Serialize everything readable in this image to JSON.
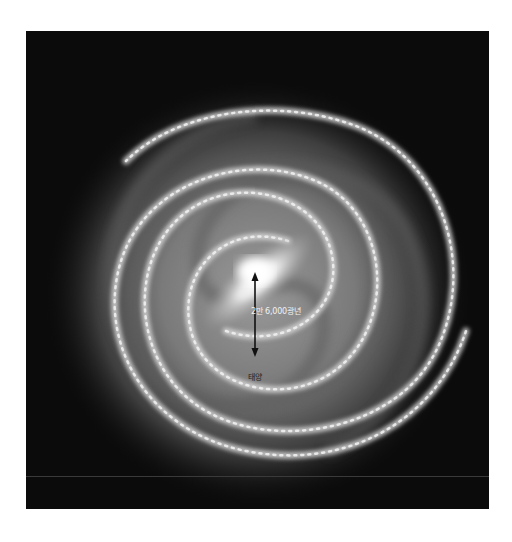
{
  "figure": {
    "background_color": "#0b0b0b",
    "annotations": {
      "distance_label": "2만 6,000광년",
      "sun_label": "태양"
    },
    "arrow": {
      "from": "galactic-center",
      "to": "sun",
      "style": "double-headed",
      "color": "#111111"
    }
  }
}
